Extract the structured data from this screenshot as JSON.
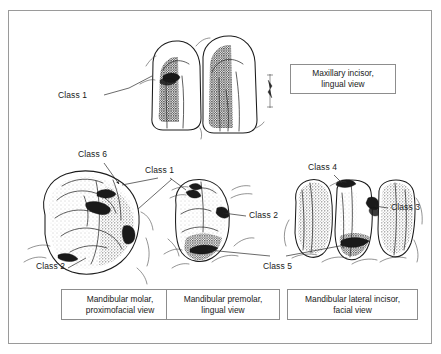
{
  "figure": {
    "border_color": "#9a9a9a",
    "ink_color": "#1a1a1a"
  },
  "panels": [
    {
      "id": "maxillary-incisor",
      "caption_line1": "Maxillary incisor,",
      "caption_line2": "lingual view",
      "labels": [
        "Class 1"
      ]
    },
    {
      "id": "mandibular-molar",
      "caption_line1": "Mandibular molar,",
      "caption_line2": "proximofacial view",
      "labels": [
        "Class 6",
        "Class 2"
      ]
    },
    {
      "id": "mandibular-premolar",
      "caption_line1": "Mandibular premolar,",
      "caption_line2": "lingual view",
      "labels": [
        "Class 1",
        "Class 2",
        "Class 5"
      ]
    },
    {
      "id": "mandibular-lateral-incisor",
      "caption_line1": "Mandibular lateral incisor,",
      "caption_line2": "facial view",
      "labels": [
        "Class 4",
        "Class 3",
        "Class 5"
      ]
    }
  ],
  "callouts": {
    "top_class1": "Class 1",
    "class6": "Class 6",
    "mid_class1": "Class 1",
    "class2_molar": "Class 2",
    "class2_premolar": "Class 2",
    "class5": "Class 5",
    "class4": "Class 4",
    "class3": "Class 3"
  },
  "captions": {
    "maxillary_l1": "Maxillary incisor,",
    "maxillary_l2": "lingual view",
    "molar_l1": "Mandibular molar,",
    "molar_l2": "proximofacial view",
    "premolar_l1": "Mandibular premolar,",
    "premolar_l2": "lingual view",
    "incisor_l1": "Mandibular lateral incisor,",
    "incisor_l2": "facial view"
  }
}
